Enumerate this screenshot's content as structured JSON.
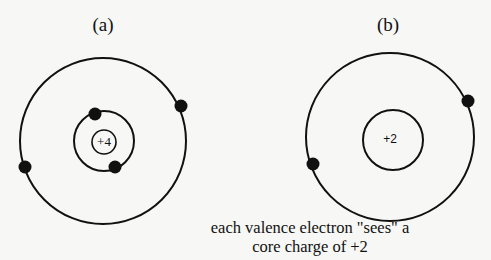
{
  "diagrams": [
    {
      "label": "(a)",
      "core_charge": "+4",
      "shells": [
        {
          "radius": 12,
          "role": "nucleus"
        },
        {
          "radius": 30,
          "electrons": 2
        },
        {
          "radius": 83,
          "electrons": 2
        }
      ]
    },
    {
      "label": "(b)",
      "core_charge": "+2",
      "shells": [
        {
          "radius": 30,
          "role": "core"
        },
        {
          "radius": 84,
          "electrons": 2
        }
      ]
    }
  ],
  "caption": {
    "line1": "each valence electron \"sees\" a",
    "line2": "core charge of +2"
  },
  "colors": {
    "stroke": "#111111",
    "background": "#f7f7f5"
  }
}
